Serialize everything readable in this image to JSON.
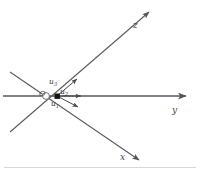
{
  "figure": {
    "kind": "3d-coordinate-axes-with-unit-vectors",
    "background_color": "#ffffff",
    "line_color": "#555555",
    "node_color": "#1a1a1a",
    "label_color": "#3a3a3a"
  },
  "axes": [
    {
      "id": "z",
      "label": "z",
      "direction": "upper-right",
      "label_position": {
        "x": 133,
        "y": 21
      },
      "arrow_tip": {
        "x": 148,
        "y": 12
      },
      "tail": {
        "x": 10,
        "y": 132
      },
      "origin_end": {
        "x": 57,
        "y": 96
      }
    },
    {
      "id": "y",
      "label": "y",
      "direction": "right-horizontal",
      "label_position": {
        "x": 172,
        "y": 106
      },
      "arrow_tip": {
        "x": 186,
        "y": 96
      },
      "tail": {
        "x": 3,
        "y": 96
      },
      "origin_end": {
        "x": 57,
        "y": 96
      }
    },
    {
      "id": "x",
      "label": "x",
      "direction": "lower-right",
      "label_position": {
        "x": 120,
        "y": 153
      },
      "arrow_tip": {
        "x": 139,
        "y": 160
      },
      "tail": {
        "x": 10,
        "y": 72
      },
      "origin_end": {
        "x": 57,
        "y": 96
      }
    }
  ],
  "origin": {
    "label": "O",
    "node_shape": "filled-square",
    "node_position": {
      "x": 57,
      "y": 96
    },
    "node_size": 5,
    "label_position": {
      "x": 39,
      "y": 90
    }
  },
  "vectors": [
    {
      "id": "u1",
      "label_base": "u",
      "label_sub": "1",
      "description": "unit vector pointing lower-right toward x axis",
      "start": {
        "x": 57,
        "y": 96
      },
      "end": {
        "x": 79,
        "y": 107
      },
      "label_position": {
        "x": 51,
        "y": 100
      }
    },
    {
      "id": "u2",
      "label_base": "u",
      "label_sub": "2",
      "description": "unit vector pointing right along y axis",
      "start": {
        "x": 57,
        "y": 96
      },
      "end": {
        "x": 83,
        "y": 96
      },
      "label_position": {
        "x": 60,
        "y": 88
      }
    },
    {
      "id": "u3",
      "label_base": "u",
      "label_sub": "3",
      "description": "unit vector pointing upper-right toward z axis",
      "start": {
        "x": 57,
        "y": 96
      },
      "end": {
        "x": 78,
        "y": 78
      },
      "label_position": {
        "x": 49,
        "y": 78
      }
    }
  ],
  "decorations": {
    "bottom_rule": true
  }
}
